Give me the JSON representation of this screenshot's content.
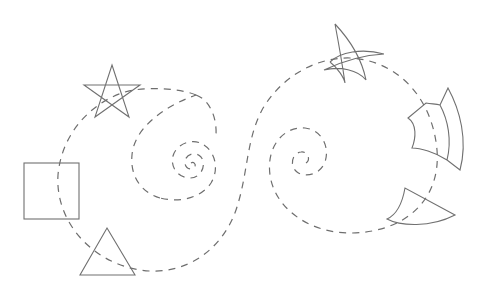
{
  "diagram": {
    "stroke_color": "#707070",
    "background": "#ffffff",
    "source_shapes": [
      {
        "name": "star",
        "center": [
          112,
          92
        ]
      },
      {
        "name": "square",
        "bounds": [
          24,
          163,
          79,
          219
        ]
      },
      {
        "name": "triangle",
        "apex": [
          107,
          228
        ],
        "base": [
          [
            80,
            275
          ],
          [
            135,
            275
          ]
        ]
      }
    ],
    "mapped_shapes": [
      {
        "name": "warped-star",
        "region": [
          325,
          20,
          385,
          85
        ]
      },
      {
        "name": "warped-square",
        "region": [
          408,
          88,
          465,
          172
        ]
      },
      {
        "name": "warped-triangle",
        "region": [
          386,
          188,
          455,
          228
        ]
      }
    ],
    "spirals": [
      {
        "name": "left-spiral",
        "center": [
          191,
          163
        ]
      },
      {
        "name": "right-spiral",
        "center": [
          305,
          160
        ]
      }
    ]
  }
}
